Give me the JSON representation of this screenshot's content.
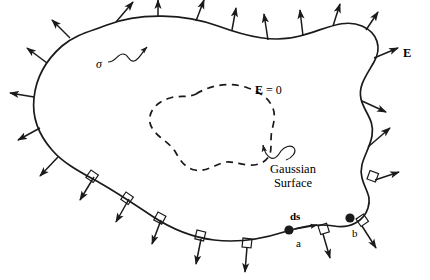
{
  "figure": {
    "background_color": "#ffffff",
    "stroke_color": "#1a1a1a",
    "labels": {
      "e_field": "E",
      "e_zero_symbol": "E",
      "e_zero_rest": " = 0",
      "surface_charge_density": "σ",
      "gaussian_line1": "Gaussian",
      "gaussian_line2": "Surface",
      "ds_vector": "ds",
      "point_a": "a",
      "point_b": "b"
    },
    "elements": {
      "outer_boundary": "solid-irregular-closed-curve",
      "inner_boundary": "dashed-irregular-closed-curve",
      "field_arrows": "outward-normal-arrows",
      "right_angle_marks": "perpendicular-squares-on-lower-surface",
      "point_markers": "filled-dots"
    }
  }
}
